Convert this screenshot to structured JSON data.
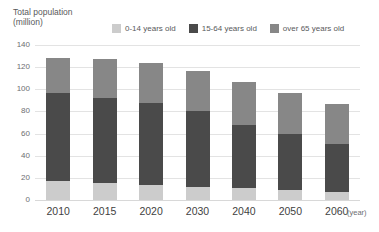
{
  "axis_title": {
    "line1": "Total population",
    "line2": "(million)"
  },
  "x_unit_label": "(year)",
  "legend": {
    "items": [
      {
        "label": "0-14 years old",
        "color": "#cccccc"
      },
      {
        "label": "15-64 years old",
        "color": "#4a4a4a"
      },
      {
        "label": "over 65 years old",
        "color": "#878787"
      }
    ]
  },
  "y_ticks": [
    "0",
    "20",
    "40",
    "60",
    "80",
    "100",
    "120",
    "140"
  ],
  "x_ticks": [
    "2010",
    "2015",
    "2020",
    "2030",
    "2040",
    "2050",
    "2060"
  ],
  "chart_data": {
    "type": "bar",
    "title": "Total population (million)",
    "xlabel": "(year)",
    "ylabel": "Total population (million)",
    "stacked": true,
    "grid": true,
    "legend_position": "top",
    "ylim": [
      0,
      140
    ],
    "ytick_step": 20,
    "categories": [
      "2010",
      "2015",
      "2020",
      "2030",
      "2040",
      "2050",
      "2060"
    ],
    "series": [
      {
        "name": "0-14 years old",
        "color": "#cccccc",
        "values": [
          17,
          15.5,
          14,
          11.5,
          10.5,
          9,
          7
        ]
      },
      {
        "name": "15-64 years old",
        "color": "#4a4a4a",
        "values": [
          80,
          76.5,
          73.5,
          68.5,
          57.5,
          51,
          44
        ]
      },
      {
        "name": "over 65 years old",
        "color": "#878787",
        "values": [
          31,
          35,
          36,
          37,
          39,
          37,
          36
        ]
      }
    ],
    "totals": [
      128,
      127,
      123.5,
      117,
      107,
      97,
      87
    ]
  }
}
